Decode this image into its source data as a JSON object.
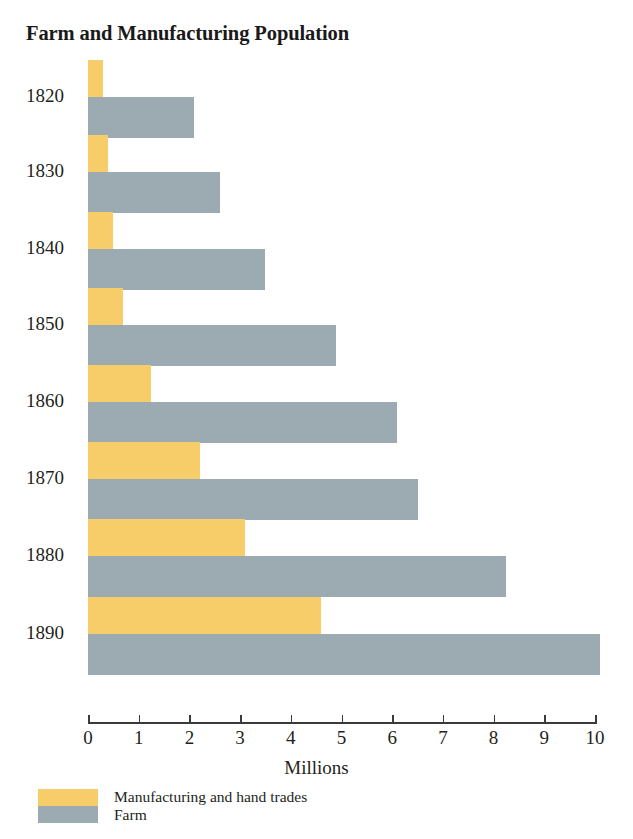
{
  "chart_data": {
    "type": "bar",
    "orientation": "horizontal",
    "title": "Farm and Manufacturing Population",
    "xlabel": "Millions",
    "ylabel": "",
    "xlim": [
      0,
      10
    ],
    "xticks": [
      "0",
      "1",
      "2",
      "3",
      "4",
      "5",
      "6",
      "7",
      "8",
      "9",
      "10"
    ],
    "grid": false,
    "legend_position": "bottom-left",
    "categories": [
      "1820",
      "1830",
      "1840",
      "1850",
      "1860",
      "1870",
      "1880",
      "1890"
    ],
    "series": [
      {
        "name": "Manufacturing and hand trades",
        "color": "#f7cd69",
        "values": [
          0.3,
          0.4,
          0.5,
          0.7,
          1.25,
          2.2,
          3.1,
          4.6
        ]
      },
      {
        "name": "Farm",
        "color": "#9caab2",
        "values": [
          2.1,
          2.6,
          3.5,
          4.9,
          6.1,
          6.5,
          8.25,
          10.1
        ]
      }
    ]
  },
  "legend": {
    "entries": [
      {
        "label": "Manufacturing and hand trades"
      },
      {
        "label": "Farm"
      }
    ]
  }
}
